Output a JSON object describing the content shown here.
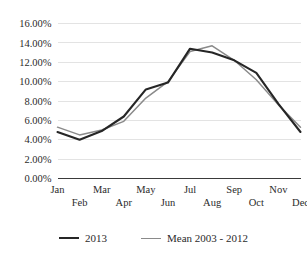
{
  "chart_data": {
    "type": "line",
    "title": "",
    "xlabel": "",
    "ylabel": "",
    "ylim": [
      0,
      16
    ],
    "yticks": [
      "0.00%",
      "2.00%",
      "4.00%",
      "6.00%",
      "8.00%",
      "10.00%",
      "12.00%",
      "14.00%",
      "16.00%"
    ],
    "ytick_values": [
      0,
      2,
      4,
      6,
      8,
      10,
      12,
      14,
      16
    ],
    "grid": true,
    "legend_position": "bottom",
    "categories": [
      "Jan",
      "Feb",
      "Mar",
      "Apr",
      "May",
      "Jun",
      "Jul",
      "Aug",
      "Sep",
      "Oct",
      "Nov",
      "Dec"
    ],
    "series": [
      {
        "name": "2013",
        "color": "#262626",
        "values": [
          4.8,
          4.0,
          4.9,
          6.4,
          9.2,
          9.9,
          13.4,
          13.0,
          12.2,
          10.9,
          7.7,
          4.8
        ]
      },
      {
        "name": "Mean 2003 - 2012",
        "color": "#8a8a8a",
        "values": [
          5.3,
          4.5,
          5.0,
          5.9,
          8.3,
          10.0,
          13.1,
          13.7,
          12.2,
          10.2,
          7.6,
          5.3
        ]
      }
    ]
  },
  "legend": {
    "entries": [
      {
        "label": "2013"
      },
      {
        "label": "Mean 2003 - 2012"
      }
    ]
  }
}
